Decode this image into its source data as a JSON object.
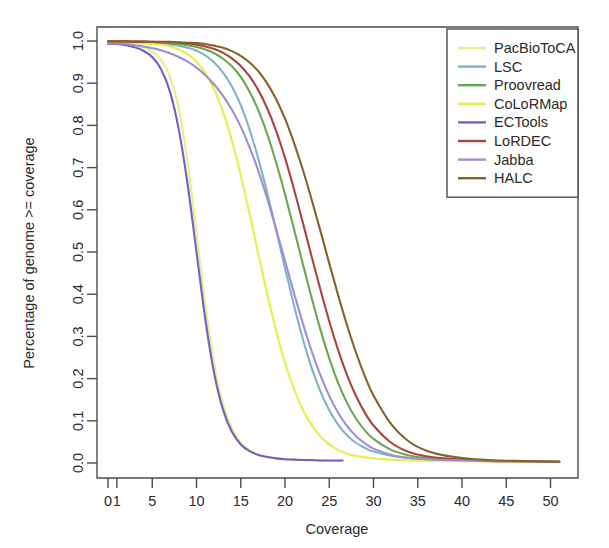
{
  "chart_data": {
    "type": "line",
    "title": "",
    "xlabel": "Coverage",
    "ylabel": "Percentage of genome >= coverage",
    "xlim": [
      0,
      52
    ],
    "ylim": [
      0.0,
      1.0
    ],
    "grid": false,
    "legend_position": "top-right",
    "xticks": [
      0,
      1,
      5,
      10,
      15,
      20,
      25,
      30,
      35,
      40,
      45,
      50
    ],
    "xticklabels": [
      "0",
      "1",
      "5",
      "10",
      "15",
      "20",
      "25",
      "30",
      "35",
      "40",
      "45",
      "50"
    ],
    "yticks": [
      0.0,
      0.1,
      0.2,
      0.3,
      0.4,
      0.5,
      0.6,
      0.7,
      0.8,
      0.9,
      1.0
    ],
    "yticklabels": [
      "0.0",
      "0.1",
      "0.2",
      "0.3",
      "0.4",
      "0.5",
      "0.6",
      "0.7",
      "0.8",
      "0.9",
      "1.0"
    ],
    "series": [
      {
        "name": "PacBioToCA",
        "color": "#e8ee87",
        "midpoint": 11.0,
        "x_end": 26.5,
        "x": [
          0,
          1,
          2,
          3,
          4,
          5,
          6,
          7,
          8,
          9,
          10,
          11,
          12,
          13,
          14,
          15,
          16,
          17,
          18,
          19,
          20,
          21,
          22,
          23,
          24,
          25,
          26.5
        ],
        "values": [
          0.995,
          0.995,
          0.993,
          0.99,
          0.985,
          0.975,
          0.955,
          0.915,
          0.84,
          0.71,
          0.545,
          0.375,
          0.235,
          0.14,
          0.082,
          0.048,
          0.03,
          0.02,
          0.014,
          0.011,
          0.009,
          0.008,
          0.007,
          0.006,
          0.006,
          0.005,
          0.005
        ]
      },
      {
        "name": "LSC",
        "color": "#7fb3c8",
        "midpoint": 21.4,
        "x_end": 51.0,
        "x": [
          0,
          1,
          2,
          3,
          4,
          5,
          6,
          7,
          8,
          9,
          10,
          11,
          12,
          13,
          14,
          15,
          16,
          17,
          18,
          19,
          20,
          21,
          22,
          23,
          24,
          25,
          26,
          27,
          28,
          29,
          30,
          32,
          34,
          36,
          38,
          40,
          43,
          46,
          51
        ],
        "values": [
          0.997,
          0.997,
          0.997,
          0.996,
          0.996,
          0.995,
          0.994,
          0.992,
          0.989,
          0.984,
          0.977,
          0.966,
          0.949,
          0.925,
          0.892,
          0.848,
          0.79,
          0.72,
          0.64,
          0.552,
          0.462,
          0.375,
          0.295,
          0.226,
          0.17,
          0.125,
          0.091,
          0.066,
          0.048,
          0.036,
          0.027,
          0.017,
          0.012,
          0.009,
          0.007,
          0.006,
          0.005,
          0.004,
          0.003
        ]
      },
      {
        "name": "Proovread",
        "color": "#6aa84f",
        "midpoint": 23.4,
        "x_end": 51.0,
        "x": [
          0,
          1,
          2,
          3,
          4,
          5,
          6,
          7,
          8,
          9,
          10,
          11,
          12,
          13,
          14,
          15,
          16,
          17,
          18,
          19,
          20,
          21,
          22,
          23,
          24,
          25,
          26,
          27,
          28,
          29,
          30,
          32,
          34,
          36,
          38,
          40,
          43,
          46,
          51
        ],
        "values": [
          0.998,
          0.998,
          0.998,
          0.997,
          0.997,
          0.997,
          0.996,
          0.995,
          0.993,
          0.99,
          0.986,
          0.98,
          0.971,
          0.958,
          0.94,
          0.915,
          0.88,
          0.835,
          0.779,
          0.712,
          0.637,
          0.556,
          0.473,
          0.392,
          0.316,
          0.248,
          0.19,
          0.143,
          0.106,
          0.078,
          0.057,
          0.031,
          0.018,
          0.012,
          0.009,
          0.007,
          0.005,
          0.004,
          0.003
        ]
      },
      {
        "name": "CoLoRMap",
        "color": "#e5ef4a",
        "midpoint": 18.1,
        "x_end": 51.0,
        "x": [
          0,
          1,
          2,
          3,
          4,
          5,
          6,
          7,
          8,
          9,
          10,
          11,
          12,
          13,
          14,
          15,
          16,
          17,
          18,
          19,
          20,
          21,
          22,
          23,
          24,
          25,
          26,
          27,
          28,
          30,
          33,
          36,
          40,
          45,
          51
        ],
        "values": [
          0.996,
          0.996,
          0.996,
          0.995,
          0.994,
          0.993,
          0.991,
          0.987,
          0.98,
          0.969,
          0.951,
          0.924,
          0.885,
          0.832,
          0.764,
          0.682,
          0.59,
          0.494,
          0.4,
          0.313,
          0.238,
          0.176,
          0.127,
          0.09,
          0.063,
          0.044,
          0.031,
          0.022,
          0.017,
          0.011,
          0.007,
          0.005,
          0.004,
          0.003,
          0.003
        ]
      },
      {
        "name": "ECTools",
        "color": "#6c63c4",
        "midpoint": 9.9,
        "x_end": 26.5,
        "x": [
          0,
          1,
          2,
          3,
          4,
          5,
          6,
          7,
          8,
          9,
          10,
          11,
          12,
          13,
          14,
          15,
          16,
          17,
          18,
          19,
          20,
          21,
          22,
          23,
          24,
          25,
          26.5
        ],
        "values": [
          0.993,
          0.993,
          0.99,
          0.985,
          0.977,
          0.962,
          0.933,
          0.88,
          0.79,
          0.66,
          0.5,
          0.34,
          0.212,
          0.126,
          0.074,
          0.044,
          0.028,
          0.019,
          0.014,
          0.011,
          0.009,
          0.008,
          0.007,
          0.007,
          0.006,
          0.006,
          0.006
        ]
      },
      {
        "name": "LoRDEC",
        "color": "#a8453c",
        "midpoint": 24.5,
        "x_end": 51.0,
        "x": [
          0,
          1,
          2,
          3,
          4,
          5,
          6,
          7,
          8,
          9,
          10,
          11,
          12,
          13,
          14,
          15,
          16,
          17,
          18,
          19,
          20,
          21,
          22,
          23,
          24,
          25,
          26,
          27,
          28,
          29,
          30,
          32,
          34,
          36,
          38,
          40,
          43,
          46,
          51
        ],
        "values": [
          0.999,
          0.999,
          0.999,
          0.998,
          0.998,
          0.998,
          0.997,
          0.997,
          0.996,
          0.994,
          0.991,
          0.987,
          0.981,
          0.972,
          0.959,
          0.941,
          0.916,
          0.883,
          0.84,
          0.787,
          0.723,
          0.65,
          0.571,
          0.49,
          0.411,
          0.336,
          0.268,
          0.209,
          0.16,
          0.12,
          0.089,
          0.048,
          0.026,
          0.016,
          0.011,
          0.008,
          0.005,
          0.004,
          0.003
        ]
      },
      {
        "name": "Jabba",
        "color": "#9b8fd6",
        "midpoint": 22.0,
        "x_end": 51.0,
        "x": [
          0,
          1,
          2,
          3,
          4,
          5,
          6,
          7,
          8,
          9,
          10,
          11,
          12,
          13,
          14,
          15,
          16,
          17,
          18,
          19,
          20,
          21,
          22,
          23,
          24,
          25,
          26,
          27,
          28,
          29,
          30,
          32,
          34,
          36,
          38,
          40,
          43,
          46,
          51
        ],
        "values": [
          0.994,
          0.994,
          0.993,
          0.99,
          0.987,
          0.983,
          0.978,
          0.971,
          0.962,
          0.951,
          0.937,
          0.919,
          0.897,
          0.87,
          0.837,
          0.797,
          0.748,
          0.691,
          0.626,
          0.554,
          0.479,
          0.404,
          0.332,
          0.266,
          0.208,
          0.159,
          0.119,
          0.088,
          0.064,
          0.047,
          0.034,
          0.019,
          0.012,
          0.009,
          0.007,
          0.006,
          0.004,
          0.004,
          0.003
        ]
      },
      {
        "name": "HALC",
        "color": "#86622a",
        "midpoint": 25.9,
        "x_end": 51.0,
        "x": [
          0,
          1,
          2,
          3,
          4,
          5,
          6,
          7,
          8,
          9,
          10,
          11,
          12,
          13,
          14,
          15,
          16,
          17,
          18,
          19,
          20,
          21,
          22,
          23,
          24,
          25,
          26,
          27,
          28,
          29,
          30,
          32,
          34,
          36,
          38,
          40,
          43,
          46,
          51
        ],
        "values": [
          0.999,
          0.999,
          0.999,
          0.999,
          0.999,
          0.998,
          0.998,
          0.998,
          0.997,
          0.996,
          0.995,
          0.993,
          0.989,
          0.984,
          0.976,
          0.965,
          0.949,
          0.928,
          0.899,
          0.862,
          0.816,
          0.76,
          0.696,
          0.625,
          0.55,
          0.473,
          0.398,
          0.327,
          0.263,
          0.207,
          0.16,
          0.092,
          0.051,
          0.029,
          0.018,
          0.012,
          0.007,
          0.005,
          0.003
        ]
      }
    ]
  }
}
